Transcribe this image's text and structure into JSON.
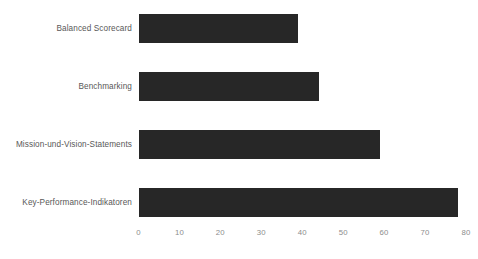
{
  "chart_data": {
    "type": "bar",
    "orientation": "horizontal",
    "title": "",
    "subtitle": "",
    "xlabel": "",
    "ylabel": "",
    "categories": [
      "Balanced Scorecard",
      "Benchmarking",
      "Mission-und-Vision-Statements",
      "Key-Performance-Indikatoren"
    ],
    "values": [
      39,
      44,
      59,
      78
    ],
    "xticks": [
      "0",
      "10",
      "20",
      "30",
      "40",
      "50",
      "60",
      "70",
      "80"
    ],
    "xtick_values": [
      0,
      10,
      20,
      30,
      40,
      50,
      60,
      70,
      80
    ],
    "xlim": [
      0,
      80
    ],
    "grid": false,
    "legend": null,
    "bar_color": "#272727",
    "label_color": "#585858",
    "tick_color": "#8d8d8d",
    "background": "#ffffff"
  }
}
